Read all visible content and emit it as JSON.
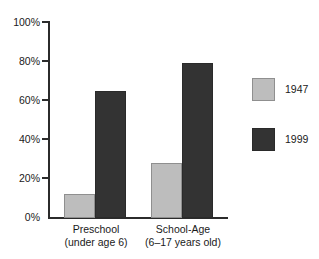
{
  "chart_data": {
    "type": "bar",
    "title": "",
    "subtitle": "",
    "xlabel": "",
    "ylabel": "",
    "ylim": [
      0,
      100
    ],
    "y_tick_labels": [
      "100%",
      "80%",
      "60%",
      "40%",
      "20%",
      "0%"
    ],
    "y_tick_values": [
      100,
      80,
      60,
      40,
      20,
      0
    ],
    "grid": false,
    "legend_position": "right",
    "categories": [
      "Preschool",
      "School-Age"
    ],
    "category_sublabels": [
      "(under age 6)",
      "(6–17 years old)"
    ],
    "series": [
      {
        "name": "1947",
        "color": "#bdbdbd",
        "values": [
          12,
          28
        ]
      },
      {
        "name": "1999",
        "color": "#333333",
        "values": [
          65,
          79
        ]
      }
    ]
  },
  "axis": {
    "tick_0": "100%",
    "tick_1": "80%",
    "tick_2": "60%",
    "tick_3": "40%",
    "tick_4": "20%",
    "tick_5": "0%"
  },
  "categories": [
    {
      "line1": "Preschool",
      "line2": "(under age 6)"
    },
    {
      "line1": "School-Age",
      "line2": "(6–17 years old)"
    }
  ],
  "legend": {
    "items": [
      {
        "label": "1947",
        "swatch": "legend-swatch-1947"
      },
      {
        "label": "1999",
        "swatch": "legend-swatch-1999"
      }
    ]
  },
  "bars": [
    {
      "group": "Preschool",
      "series": "1947",
      "value": 12
    },
    {
      "group": "Preschool",
      "series": "1999",
      "value": 65
    },
    {
      "group": "School-Age",
      "series": "1947",
      "value": 28
    },
    {
      "group": "School-Age",
      "series": "1999",
      "value": 79
    }
  ]
}
